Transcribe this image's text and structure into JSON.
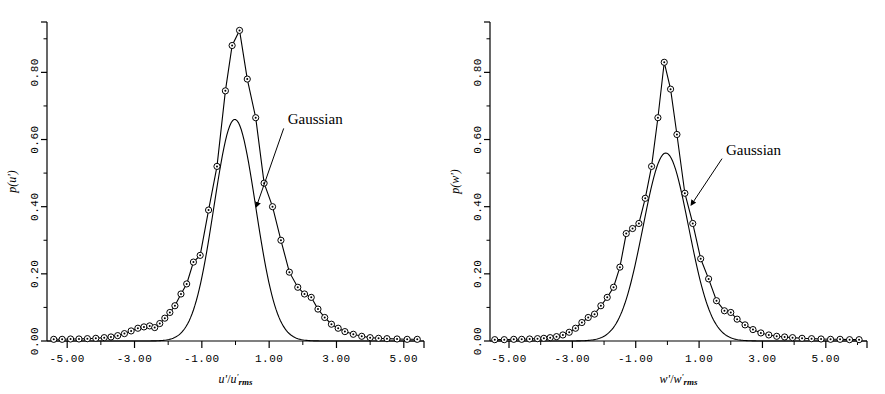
{
  "figure": {
    "background": "#ffffff",
    "ink": "#000000"
  },
  "chart_data": [
    {
      "type": "line",
      "panel": "left",
      "title": "",
      "xlabel": "u'/u'rms",
      "ylabel": "p(u')",
      "xlim": [
        -5.6,
        5.6
      ],
      "ylim": [
        0.0,
        0.95
      ],
      "xticks": [
        -5.0,
        -3.0,
        -1.0,
        1.0,
        3.0,
        5.0
      ],
      "xticklabels": [
        "-5.00",
        "-3.00",
        "-1.00",
        "1.00",
        "3.00",
        "5.00"
      ],
      "yticks": [
        0.0,
        0.2,
        0.4,
        0.6,
        0.8
      ],
      "yticklabels": [
        "0.00",
        "0.20",
        "0.40",
        "0.60",
        "0.80"
      ],
      "minor_x_step": 1.0,
      "minor_y_step": 0.1,
      "grid": false,
      "legend": "none",
      "annotations": [
        {
          "text": "Gaussian",
          "x": 1.55,
          "y": 0.645,
          "arrow_to_x": 0.62,
          "arrow_to_y": 0.4
        }
      ],
      "series": [
        {
          "name": "measured",
          "marker": "circle-dot",
          "x": [
            -5.4,
            -5.15,
            -4.9,
            -4.65,
            -4.4,
            -4.15,
            -3.9,
            -3.7,
            -3.5,
            -3.3,
            -3.1,
            -2.9,
            -2.72,
            -2.55,
            -2.4,
            -2.25,
            -2.1,
            -1.95,
            -1.8,
            -1.62,
            -1.45,
            -1.25,
            -1.05,
            -0.8,
            -0.55,
            -0.3,
            -0.1,
            0.12,
            0.35,
            0.6,
            0.85,
            1.1,
            1.35,
            1.6,
            1.85,
            2.05,
            2.25,
            2.45,
            2.65,
            2.85,
            3.05,
            3.25,
            3.5,
            3.75,
            4.0,
            4.25,
            4.5,
            4.8,
            5.1,
            5.4
          ],
          "y": [
            0.005,
            0.005,
            0.006,
            0.006,
            0.007,
            0.008,
            0.01,
            0.012,
            0.016,
            0.022,
            0.03,
            0.038,
            0.042,
            0.045,
            0.04,
            0.052,
            0.068,
            0.085,
            0.105,
            0.14,
            0.17,
            0.235,
            0.255,
            0.39,
            0.52,
            0.745,
            0.88,
            0.925,
            0.78,
            0.665,
            0.47,
            0.4,
            0.3,
            0.205,
            0.16,
            0.14,
            0.13,
            0.095,
            0.07,
            0.05,
            0.038,
            0.028,
            0.02,
            0.014,
            0.01,
            0.008,
            0.007,
            0.006,
            0.005,
            0.005
          ]
        },
        {
          "name": "gaussian",
          "marker": "none",
          "peak": 0.66,
          "sigma": 0.62,
          "mean": -0.02
        }
      ]
    },
    {
      "type": "line",
      "panel": "right",
      "title": "",
      "xlabel": "w'/w'rms",
      "ylabel": "p(w')",
      "xlim": [
        -5.6,
        6.3
      ],
      "ylim": [
        0.0,
        0.95
      ],
      "xticks": [
        -5.0,
        -3.0,
        -1.0,
        1.0,
        3.0,
        5.0
      ],
      "xticklabels": [
        "-5.00",
        "-3.00",
        "-1.00",
        "1.00",
        "3.00",
        "5.00"
      ],
      "yticks": [
        0.0,
        0.2,
        0.4,
        0.6,
        0.8
      ],
      "yticklabels": [
        "0.00",
        "0.20",
        "0.40",
        "0.60",
        "0.80"
      ],
      "minor_x_step": 1.0,
      "minor_y_step": 0.1,
      "grid": false,
      "legend": "none",
      "annotations": [
        {
          "text": "Gaussian",
          "x": 1.85,
          "y": 0.555,
          "arrow_to_x": 0.75,
          "arrow_to_y": 0.405
        }
      ],
      "series": [
        {
          "name": "measured",
          "marker": "circle-dot",
          "x": [
            -5.45,
            -5.15,
            -4.85,
            -4.6,
            -4.35,
            -4.1,
            -3.9,
            -3.7,
            -3.5,
            -3.3,
            -3.1,
            -2.9,
            -2.7,
            -2.5,
            -2.3,
            -2.1,
            -1.9,
            -1.7,
            -1.5,
            -1.3,
            -1.1,
            -0.9,
            -0.7,
            -0.5,
            -0.3,
            -0.1,
            0.1,
            0.3,
            0.55,
            0.8,
            1.05,
            1.3,
            1.55,
            1.8,
            2.0,
            2.2,
            2.45,
            2.7,
            2.95,
            3.2,
            3.45,
            3.7,
            3.95,
            4.25,
            4.55,
            4.85,
            5.15,
            5.45,
            5.75,
            6.05
          ],
          "y": [
            0.004,
            0.004,
            0.005,
            0.005,
            0.006,
            0.007,
            0.008,
            0.01,
            0.013,
            0.018,
            0.026,
            0.038,
            0.055,
            0.07,
            0.08,
            0.105,
            0.13,
            0.16,
            0.22,
            0.32,
            0.335,
            0.35,
            0.425,
            0.52,
            0.665,
            0.83,
            0.75,
            0.615,
            0.44,
            0.35,
            0.245,
            0.185,
            0.12,
            0.09,
            0.085,
            0.065,
            0.048,
            0.034,
            0.024,
            0.018,
            0.014,
            0.012,
            0.01,
            0.008,
            0.007,
            0.006,
            0.005,
            0.005,
            0.004,
            0.004
          ]
        },
        {
          "name": "gaussian",
          "marker": "none",
          "peak": 0.56,
          "sigma": 0.72,
          "mean": -0.05
        }
      ]
    }
  ]
}
